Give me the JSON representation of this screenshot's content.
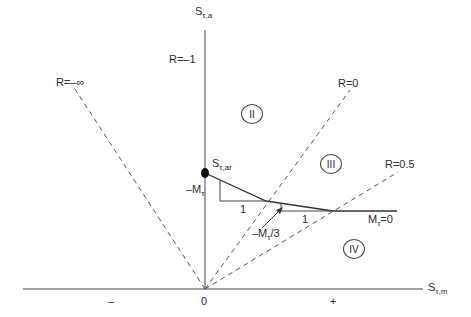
{
  "diagram": {
    "type": "Haigh-type fatigue diagram (mean vs alternating shear stress)",
    "axes": {
      "vertical": {
        "base": "S",
        "sub": "τ,a"
      },
      "horizontal": {
        "base": "S",
        "sub": "τ,m"
      },
      "origin_label": "0",
      "negative_label": "–",
      "positive_label": "+"
    },
    "stress_ratio_lines": [
      {
        "label": "R=–∞"
      },
      {
        "label": "R=–1"
      },
      {
        "label": "R=0"
      },
      {
        "label": "R=0.5"
      }
    ],
    "regions": [
      {
        "label": "II"
      },
      {
        "label": "III"
      },
      {
        "label": "IV"
      }
    ],
    "point": {
      "base": "S",
      "sub": "τ,ar"
    },
    "slopes": {
      "slope1": {
        "base": "–M",
        "sub": "τ",
        "run": "1"
      },
      "slope2": {
        "base": "–M",
        "sub": "τ",
        "suffix": "/3",
        "run": "1"
      },
      "slope3": {
        "base": "M",
        "sub": "τ",
        "suffix": "=0"
      }
    },
    "colors": {
      "line": "#3a3a3a",
      "dashed": "#555555",
      "background": "#ffffff"
    }
  }
}
